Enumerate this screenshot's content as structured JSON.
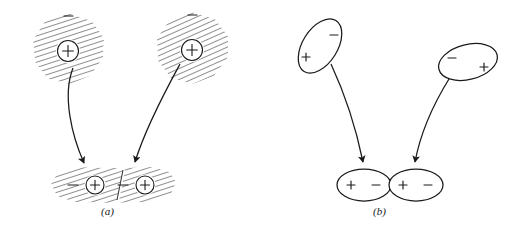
{
  "figure": {
    "width": 506,
    "height": 239,
    "background_color": "#ffffff",
    "ink_color": "#1a1a1a",
    "description": "Two-panel schematic of induced dipole interaction between two atoms forming a polarized pair"
  },
  "panels": [
    {
      "id": "a",
      "caption": "(a)",
      "style": "hatched electron cloud representation",
      "top_particles": [
        {
          "name": "atom-left",
          "nucleus_symbol": "+",
          "cloud_symbol": "−",
          "shape": "hatched irregular blob",
          "center_x": 68,
          "center_y": 51
        },
        {
          "name": "atom-right",
          "nucleus_symbol": "+",
          "cloud_symbol": "−",
          "shape": "hatched irregular blob",
          "center_x": 192,
          "center_y": 50
        }
      ],
      "bottom_molecule": {
        "name": "polarized-pair",
        "shape": "hatched double lobe",
        "charges": [
          "−",
          "+",
          "−",
          "+"
        ],
        "center_x": 113,
        "center_y": 185
      },
      "arrows": [
        {
          "name": "arrow-left",
          "from_x": 76,
          "from_y": 70,
          "to_x": 84,
          "to_y": 170
        },
        {
          "name": "arrow-right",
          "from_x": 182,
          "from_y": 66,
          "to_x": 133,
          "to_y": 170
        }
      ]
    },
    {
      "id": "b",
      "caption": "(b)",
      "style": "simplified ellipse dipole representation",
      "top_particles": [
        {
          "name": "dipole-left",
          "shape": "tilted ellipse",
          "charges": [
            "−",
            "+"
          ],
          "minus_position": "upper-right",
          "plus_position": "lower-left",
          "center_x": 320,
          "center_y": 46,
          "rotation_deg": -58
        },
        {
          "name": "dipole-right",
          "shape": "tilted ellipse",
          "charges": [
            "−",
            "+"
          ],
          "minus_position": "left",
          "plus_position": "right",
          "center_x": 468,
          "center_y": 62,
          "rotation_deg": -14
        }
      ],
      "bottom_molecule": {
        "name": "polarized-dipole-pair",
        "shape": "two touching ellipses",
        "left_ellipse_charges": [
          "+",
          "−"
        ],
        "right_ellipse_charges": [
          "+",
          "−"
        ],
        "center_x": 389,
        "center_y": 185
      },
      "arrows": [
        {
          "name": "arrow-left",
          "from_x": 331,
          "from_y": 64,
          "to_x": 364,
          "to_y": 170
        },
        {
          "name": "arrow-right",
          "from_x": 450,
          "from_y": 78,
          "to_x": 415,
          "to_y": 170
        }
      ]
    }
  ],
  "symbols": {
    "plus": "+",
    "minus": "−"
  }
}
